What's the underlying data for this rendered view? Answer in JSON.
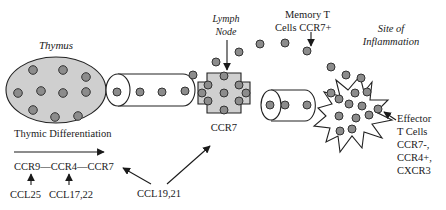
{
  "diagram": {
    "colors": {
      "organ_fill": "#cfcfcf",
      "cell_fill": "#8c8c8c",
      "stroke": "#222222",
      "text": "#1a1a1a"
    },
    "labels": {
      "thymus": "Thymus",
      "lymph_node_line1": "Lymph",
      "lymph_node_line2": "Node",
      "memory_line1": "Memory  T",
      "memory_line2": "Cells CCR7+",
      "site_line1": "Site of",
      "site_line2": "Inflammation",
      "effector_line1": "Effector",
      "effector_line2": "T Cells",
      "effector_line3": "CCR7-,",
      "effector_line4": "CCR4+,",
      "effector_line5": "CXCR3",
      "thymic_differentiation": "Thymic Differentiation",
      "receptor_sequence": "CCR9—CCR4—CCR7",
      "lymph_node_receptor": "CCR7",
      "ligand_ccl25": "CCL25",
      "ligand_ccl17_22": "CCL17,22",
      "ligand_ccl19_21": "CCL19,21"
    },
    "nodes": [
      {
        "id": "thymus",
        "shape": "ellipse",
        "label": "Thymus"
      },
      {
        "id": "vessel-1",
        "shape": "cylinder",
        "label": ""
      },
      {
        "id": "lymph-node",
        "shape": "cross",
        "label": "Lymph Node"
      },
      {
        "id": "vessel-2",
        "shape": "cylinder",
        "label": ""
      },
      {
        "id": "site-of-inflammation",
        "shape": "starburst",
        "label": "Site of Inflammation"
      }
    ],
    "edges": [
      {
        "from": "CCL25",
        "to": "CCR9"
      },
      {
        "from": "CCL17,22",
        "to": "CCR4"
      },
      {
        "from": "CCL19,21",
        "to": "CCR7 (thymic)"
      },
      {
        "from": "CCL19,21",
        "to": "CCR7 (lymph node)"
      },
      {
        "from": "Lymph Node label",
        "to": "lymph-node"
      },
      {
        "from": "Memory T Cells CCR7+ label",
        "to": "memory cell"
      },
      {
        "from": "Effector T Cells label",
        "to": "site-of-inflammation cell"
      },
      {
        "from": "Thymic Differentiation",
        "to": "CCR7",
        "type": "progression-arrow"
      }
    ]
  }
}
